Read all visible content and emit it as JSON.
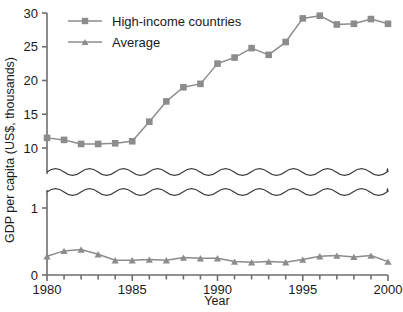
{
  "chart_data": {
    "type": "line",
    "title": "",
    "xlabel": "Year",
    "ylabel": "GDP per capita (US$, thousands)",
    "xlim": [
      1980,
      2000
    ],
    "x_tick_labels": [
      "1980",
      "1985",
      "1990",
      "1995",
      "2000"
    ],
    "x_tick_values": [
      1980,
      1985,
      1990,
      1995,
      2000
    ],
    "x_minor_ticks_every": 1,
    "y_tick_labels": [
      "0",
      "1",
      "10",
      "15",
      "20",
      "25",
      "30"
    ],
    "y_tick_values": [
      0,
      1,
      10,
      15,
      20,
      25,
      30
    ],
    "y_axis_break": true,
    "y_axis_break_note": "broken axis between 1 and 10, drawn as two wavy lines",
    "grid": false,
    "legend_position": "top-left",
    "x": [
      1980,
      1981,
      1982,
      1983,
      1984,
      1985,
      1986,
      1987,
      1988,
      1989,
      1990,
      1991,
      1992,
      1993,
      1994,
      1995,
      1996,
      1997,
      1998,
      1999,
      2000
    ],
    "series": [
      {
        "name": "High-income countries",
        "marker": "square",
        "color": "#8c8c8c",
        "values": [
          11.5,
          11.2,
          10.6,
          10.6,
          10.7,
          11.0,
          13.9,
          16.9,
          19.0,
          19.5,
          22.5,
          23.4,
          24.8,
          23.8,
          25.7,
          29.2,
          29.6,
          28.3,
          28.4,
          29.1,
          28.4
        ]
      },
      {
        "name": "Average",
        "marker": "triangle",
        "color": "#8c8c8c",
        "values": [
          0.28,
          0.36,
          0.38,
          0.31,
          0.22,
          0.22,
          0.23,
          0.22,
          0.26,
          0.25,
          0.25,
          0.2,
          0.19,
          0.2,
          0.19,
          0.23,
          0.28,
          0.29,
          0.27,
          0.29,
          0.2
        ]
      }
    ]
  },
  "legend": {
    "items": [
      {
        "label": "High-income countries",
        "marker": "square"
      },
      {
        "label": "Average",
        "marker": "triangle"
      }
    ]
  },
  "axes": {
    "x_title": "Year",
    "y_title": "GDP per capita (US$, thousands)"
  },
  "colors": {
    "series": "#8c8c8c",
    "axis": "#6e6e6e",
    "text": "#1a1a1a",
    "break": "#3a3a3a",
    "background": "#ffffff"
  }
}
